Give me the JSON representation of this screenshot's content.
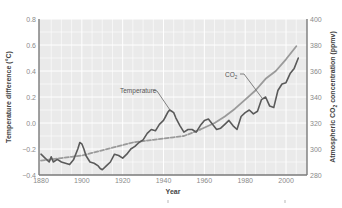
{
  "chart_data": {
    "type": "line",
    "title": "",
    "xlabel": "Year",
    "ylabel": "Temperature difference (°C)",
    "ylabel_right": "Atmospheric CO2 concentration (ppmv)",
    "xlim": [
      1880,
      2008
    ],
    "ylim": [
      -0.4,
      0.8
    ],
    "ylim_right": [
      280,
      400
    ],
    "x_ticks": [
      1880,
      1900,
      1920,
      1940,
      1960,
      1980,
      2000
    ],
    "y_ticks": [
      -0.4,
      -0.2,
      0.0,
      0.2,
      0.4,
      0.6,
      0.8
    ],
    "y_tick_labels": [
      "−0.4",
      "−0.2",
      "0.0",
      "0.2",
      "0.4",
      "0.6",
      "0.8"
    ],
    "y_ticks_right": [
      280,
      300,
      320,
      340,
      360,
      380,
      400
    ],
    "grid": true,
    "legend": "inline annotations",
    "series": [
      {
        "name": "Temperature",
        "axis": "left",
        "style": "solid",
        "color": "#5a5a5a",
        "x": [
          1880,
          1882,
          1884,
          1885,
          1886,
          1888,
          1890,
          1892,
          1894,
          1896,
          1898,
          1899,
          1900,
          1901,
          1902,
          1904,
          1906,
          1908,
          1909,
          1910,
          1912,
          1914,
          1916,
          1918,
          1920,
          1922,
          1924,
          1926,
          1928,
          1930,
          1932,
          1934,
          1936,
          1938,
          1940,
          1941,
          1942,
          1943,
          1944,
          1945,
          1946,
          1948,
          1950,
          1952,
          1954,
          1956,
          1958,
          1960,
          1962,
          1964,
          1966,
          1968,
          1970,
          1972,
          1974,
          1976,
          1978,
          1980,
          1982,
          1984,
          1986,
          1988,
          1990,
          1992,
          1994,
          1996,
          1998,
          2000,
          2002,
          2004,
          2006
        ],
        "values": [
          -0.24,
          -0.27,
          -0.3,
          -0.26,
          -0.3,
          -0.28,
          -0.3,
          -0.31,
          -0.32,
          -0.28,
          -0.2,
          -0.15,
          -0.16,
          -0.2,
          -0.25,
          -0.3,
          -0.31,
          -0.33,
          -0.35,
          -0.36,
          -0.33,
          -0.3,
          -0.24,
          -0.25,
          -0.27,
          -0.24,
          -0.2,
          -0.18,
          -0.15,
          -0.13,
          -0.08,
          -0.05,
          -0.06,
          -0.01,
          0.02,
          0.05,
          0.08,
          0.1,
          0.09,
          0.08,
          0.04,
          -0.02,
          -0.07,
          -0.05,
          -0.05,
          -0.07,
          -0.02,
          0.02,
          0.03,
          -0.01,
          -0.05,
          -0.04,
          -0.01,
          0.02,
          -0.02,
          -0.05,
          0.05,
          0.08,
          0.1,
          0.07,
          0.09,
          0.18,
          0.2,
          0.13,
          0.12,
          0.25,
          0.3,
          0.31,
          0.38,
          0.42,
          0.5
        ]
      },
      {
        "name": "CO2",
        "axis": "right",
        "style": "solid",
        "color": "#9a9a9a",
        "x": [
          1958,
          1965,
          1970,
          1975,
          1980,
          1985,
          1990,
          1995,
          2000,
          2005
        ],
        "values": [
          315,
          320,
          325,
          331,
          338,
          345,
          354,
          360,
          369,
          379
        ]
      },
      {
        "name": "CO2 (ice core)",
        "axis": "right",
        "style": "dashed",
        "color": "#9a9a9a",
        "x": [
          1880,
          1885,
          1890,
          1895,
          1900,
          1905,
          1910,
          1915,
          1920,
          1925,
          1930,
          1935,
          1940,
          1945,
          1950,
          1955,
          1958
        ],
        "values": [
          291,
          292,
          293,
          294,
          295,
          297,
          299,
          301,
          303,
          305,
          306,
          307,
          308,
          309,
          310,
          313,
          315
        ]
      }
    ],
    "annotations": [
      {
        "text": "Temperature",
        "points_to": [
          1943,
          0.1
        ]
      },
      {
        "text": "CO2",
        "points_to": [
          1987,
          348
        ]
      }
    ]
  },
  "labels": {
    "xlabel": "Year",
    "ylabel_left": "Temperature difference (°C)",
    "ylabel_right_prefix": "Atmospheric CO",
    "ylabel_right_sub": "2",
    "ylabel_right_suffix": " concentration (ppmv)",
    "annot_temperature": "Temperature",
    "annot_co2_prefix": "CO",
    "annot_co2_sub": "2"
  }
}
